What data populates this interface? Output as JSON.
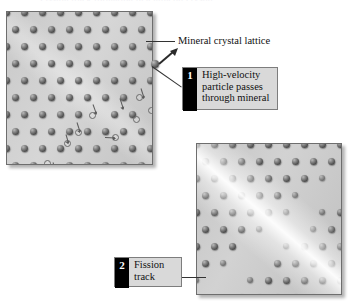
{
  "figure": {
    "title_remnant": "Fission track formation in a mineral crystal",
    "labels": {
      "lattice": "Mineral crystal lattice"
    },
    "callouts": [
      {
        "number": "1",
        "text": "High-velocity\nparticle passes\nthrough mineral"
      },
      {
        "number": "2",
        "text": "Fission\ntrack"
      }
    ],
    "panels": [
      {
        "name": "mineral-crystal-lattice-panel",
        "caption": "Mineral crystal lattice"
      },
      {
        "name": "fission-track-panel",
        "caption": "Fission track"
      }
    ],
    "colors": {
      "badge_bg": "#000000",
      "badge_text": "#ffffff",
      "callout_bg": "#d9d9d9",
      "callout_border": "#7d7d7d",
      "panel_border": "#6e6e6e",
      "atom": "#3c3c3c",
      "leader": "#333333"
    }
  },
  "lattice": {
    "cols": 8,
    "rows": 9,
    "spacing_x": 18,
    "spacing_y": 17,
    "offset_x": 9,
    "damage_angle_deg": 41
  }
}
